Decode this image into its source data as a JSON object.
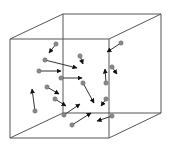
{
  "diagram": {
    "type": "3d-box-gas-particles",
    "colors": {
      "edge": "#555555",
      "arrow": "#333333",
      "particle": "#8a8a8a",
      "background": "#ffffff"
    },
    "cube": {
      "front": [
        [
          10,
          39
        ],
        [
          109,
          39
        ],
        [
          109,
          138
        ],
        [
          10,
          138
        ]
      ],
      "back": [
        [
          63,
          14
        ],
        [
          161,
          14
        ],
        [
          161,
          113
        ],
        [
          63,
          113
        ]
      ]
    },
    "particles": [
      {
        "x": 56,
        "y": 44,
        "tx": 49,
        "ty": 53
      },
      {
        "x": 45,
        "y": 60,
        "tx": 77,
        "ty": 68
      },
      {
        "x": 39,
        "y": 71,
        "tx": 61,
        "ty": 71
      },
      {
        "x": 80,
        "y": 56,
        "tx": 83,
        "ty": 64
      },
      {
        "x": 61,
        "y": 78,
        "tx": 82,
        "ty": 78
      },
      {
        "x": 83,
        "y": 83,
        "tx": 94,
        "ty": 103
      },
      {
        "x": 106,
        "y": 99,
        "tx": 101,
        "ty": 106
      },
      {
        "x": 121,
        "y": 43,
        "tx": 107,
        "ty": 52
      },
      {
        "x": 106,
        "y": 83,
        "tx": 105,
        "ty": 69
      },
      {
        "x": 112,
        "y": 67,
        "tx": 117,
        "ty": 74
      },
      {
        "x": 35,
        "y": 111,
        "tx": 32,
        "ty": 89
      },
      {
        "x": 47,
        "y": 87,
        "tx": 59,
        "ty": 94
      },
      {
        "x": 55,
        "y": 99,
        "tx": 66,
        "ty": 106
      },
      {
        "x": 64,
        "y": 115,
        "tx": 80,
        "ty": 104
      },
      {
        "x": 72,
        "y": 125,
        "tx": 91,
        "ty": 113
      },
      {
        "x": 112,
        "y": 116,
        "tx": 97,
        "ty": 121
      }
    ]
  }
}
